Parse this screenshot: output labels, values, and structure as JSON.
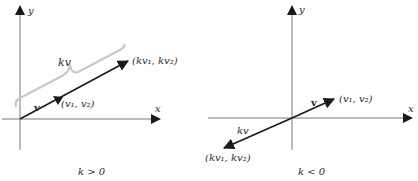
{
  "panels": [
    {
      "id": "positive",
      "axes": {
        "x_label": "x",
        "y_label": "y"
      },
      "vector_v": {
        "label": "v",
        "endpoint": "(v₁, v₂)"
      },
      "vector_kv": {
        "label": "kv",
        "endpoint": "(kv₁, kv₂)"
      },
      "caption": "k > 0"
    },
    {
      "id": "negative",
      "axes": {
        "x_label": "x",
        "y_label": "y"
      },
      "vector_v": {
        "label": "v",
        "endpoint": "(v₁, v₂)"
      },
      "vector_kv": {
        "label": "kv",
        "endpoint": "(kv₁, kv₂)"
      },
      "caption": "k < 0"
    }
  ],
  "colors": {
    "axis": "#777777",
    "vector": "#1a1a1a",
    "brace": "#c8c8c8",
    "text": "#2a2a2a"
  }
}
